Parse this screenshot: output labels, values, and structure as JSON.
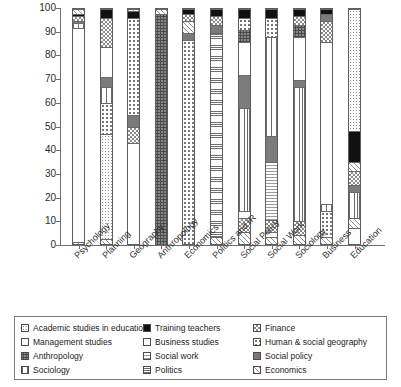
{
  "chart_data": {
    "type": "bar",
    "subtype": "stacked-100-percent",
    "title": "",
    "xlabel": "",
    "ylabel": "",
    "ylim": [
      0,
      100
    ],
    "yticks": [
      0,
      10,
      20,
      30,
      40,
      50,
      60,
      70,
      80,
      90,
      100
    ],
    "grid": false,
    "legend_position": "bottom",
    "categories": [
      "Psychology",
      "Planning",
      "Geography",
      "Anthropology",
      "Economics",
      "Politics and IR",
      "Social Policy",
      "Social Work",
      "Sociology",
      "Business",
      "Education"
    ],
    "series": [
      {
        "name": "Academic studies in education",
        "key": "p-acad",
        "values": [
          0,
          0,
          0,
          0,
          0,
          0,
          0,
          0,
          0,
          0,
          52
        ]
      },
      {
        "name": "Management studies",
        "key": "p-mgmt",
        "values": [
          92,
          0,
          0,
          0,
          0,
          0,
          3,
          2,
          0,
          3,
          7
        ]
      },
      {
        "name": "Anthropology",
        "key": "p-anthro",
        "values": [
          0,
          0,
          0,
          98,
          0,
          0,
          0,
          0,
          0,
          0,
          0
        ]
      },
      {
        "name": "Sociology",
        "key": "p-socio",
        "values": [
          2,
          7,
          0,
          0,
          0,
          0,
          43,
          45,
          57,
          3,
          11
        ]
      },
      {
        "name": "Training teachers",
        "key": "p-train",
        "values": [
          0,
          4,
          1,
          0,
          0,
          0,
          0,
          0,
          0,
          0,
          13
        ]
      },
      {
        "name": "Business studies",
        "key": "p-bus",
        "values": [
          0,
          17,
          41,
          0,
          0,
          0,
          0,
          0,
          0,
          69,
          0
        ]
      },
      {
        "name": "Social work",
        "key": "p-socwork",
        "values": [
          0,
          0,
          0,
          0,
          0,
          0,
          0,
          25,
          0,
          0,
          0
        ]
      },
      {
        "name": "Politics",
        "key": "p-pol",
        "values": [
          0,
          7,
          0,
          0,
          0,
          87,
          0,
          0,
          0,
          0,
          0
        ]
      },
      {
        "name": "Finance",
        "key": "p-fin",
        "values": [
          3,
          12,
          7,
          0,
          0,
          4,
          6,
          5,
          12,
          9,
          6
        ]
      },
      {
        "name": "Human & social geography",
        "key": "p-geo",
        "values": [
          0,
          47,
          45,
          0,
          87,
          0,
          0,
          12,
          0,
          11,
          0
        ]
      },
      {
        "name": "Social policy",
        "key": "p-socpol",
        "values": [
          0,
          4,
          5,
          0,
          8,
          6,
          14,
          11,
          3,
          3,
          3
        ]
      },
      {
        "name": "Economics",
        "key": "p-econ",
        "values": [
          3,
          2,
          1,
          2,
          5,
          3,
          34,
          0,
          28,
          2,
          8
        ]
      }
    ],
    "stack_order": [
      "Management studies",
      "Economics",
      "Human & social geography",
      "Finance",
      "Social policy",
      "Training teachers",
      "Academic studies in education",
      "Business studies",
      "Sociology",
      "Social work",
      "Politics",
      "Anthropology"
    ],
    "bars": [
      {
        "category": "Psychology",
        "segments": [
          {
            "series": "Economics",
            "key": "p-econ",
            "from": 0,
            "to": 1
          },
          {
            "series": "Management studies",
            "key": "p-mgmt",
            "from": 1,
            "to": 92
          },
          {
            "series": "Sociology",
            "key": "p-socio",
            "from": 92,
            "to": 94
          },
          {
            "series": "Social policy",
            "key": "p-socpol",
            "from": 94,
            "to": 95
          },
          {
            "series": "Finance",
            "key": "p-fin",
            "from": 95,
            "to": 97
          },
          {
            "series": "Training teachers",
            "key": "p-train",
            "from": 97,
            "to": 98
          },
          {
            "series": "Economics",
            "key": "p-econ",
            "from": 98,
            "to": 100
          }
        ]
      },
      {
        "category": "Planning",
        "segments": [
          {
            "series": "Economics",
            "key": "p-econ",
            "from": 0,
            "to": 2
          },
          {
            "series": "Academic studies in education",
            "key": "p-acad",
            "from": 2,
            "to": 47
          },
          {
            "series": "Human & social geography",
            "key": "p-geo",
            "from": 47,
            "to": 60
          },
          {
            "series": "Sociology",
            "key": "p-socio",
            "from": 60,
            "to": 67
          },
          {
            "series": "Social policy",
            "key": "p-socpol",
            "from": 67,
            "to": 71
          },
          {
            "series": "Business studies",
            "key": "p-bus",
            "from": 71,
            "to": 84
          },
          {
            "series": "Finance",
            "key": "p-fin",
            "from": 84,
            "to": 96
          },
          {
            "series": "Training teachers",
            "key": "p-train",
            "from": 96,
            "to": 100
          }
        ]
      },
      {
        "category": "Geography",
        "segments": [
          {
            "series": "Business studies",
            "key": "p-bus",
            "from": 0,
            "to": 43
          },
          {
            "series": "Finance",
            "key": "p-fin",
            "from": 43,
            "to": 50
          },
          {
            "series": "Social policy",
            "key": "p-socpol",
            "from": 50,
            "to": 55
          },
          {
            "series": "Human & social geography",
            "key": "p-geo",
            "from": 55,
            "to": 96
          },
          {
            "series": "Training teachers",
            "key": "p-train",
            "from": 96,
            "to": 99
          },
          {
            "series": "Economics",
            "key": "p-econ",
            "from": 99,
            "to": 100
          }
        ]
      },
      {
        "category": "Anthropology",
        "segments": [
          {
            "series": "Anthropology",
            "key": "p-anthro",
            "from": 0,
            "to": 98
          },
          {
            "series": "Economics",
            "key": "p-econ",
            "from": 98,
            "to": 100
          }
        ]
      },
      {
        "category": "Economics",
        "segments": [
          {
            "series": "Human & social geography",
            "key": "p-geo",
            "from": 0,
            "to": 87
          },
          {
            "series": "Social policy",
            "key": "p-socpol",
            "from": 87,
            "to": 90
          },
          {
            "series": "Economics",
            "key": "p-econ",
            "from": 90,
            "to": 95
          },
          {
            "series": "Finance",
            "key": "p-fin",
            "from": 95,
            "to": 98
          },
          {
            "series": "Training teachers",
            "key": "p-train",
            "from": 98,
            "to": 100
          }
        ]
      },
      {
        "category": "Politics and IR",
        "segments": [
          {
            "series": "Economics",
            "key": "p-econ",
            "from": 0,
            "to": 3
          },
          {
            "series": "Politics",
            "key": "p-pol",
            "from": 3,
            "to": 90
          },
          {
            "series": "Social policy",
            "key": "p-socpol",
            "from": 90,
            "to": 93
          },
          {
            "series": "Finance",
            "key": "p-fin",
            "from": 93,
            "to": 97
          },
          {
            "series": "Training teachers",
            "key": "p-train",
            "from": 97,
            "to": 100
          }
        ]
      },
      {
        "category": "Social Policy",
        "segments": [
          {
            "series": "Economics",
            "key": "p-econ",
            "from": 0,
            "to": 5
          },
          {
            "series": "Finance",
            "key": "p-fin",
            "from": 5,
            "to": 11
          },
          {
            "series": "Management studies",
            "key": "p-mgmt",
            "from": 11,
            "to": 14
          },
          {
            "series": "Sociology",
            "key": "p-socio",
            "from": 14,
            "to": 58
          },
          {
            "series": "Social policy",
            "key": "p-socpol",
            "from": 58,
            "to": 72
          },
          {
            "series": "Business studies",
            "key": "p-bus",
            "from": 72,
            "to": 86
          },
          {
            "series": "Anthropology",
            "key": "p-anthro",
            "from": 86,
            "to": 91
          },
          {
            "series": "Human & social geography",
            "key": "p-geo",
            "from": 91,
            "to": 96
          },
          {
            "series": "Training teachers",
            "key": "p-train",
            "from": 96,
            "to": 100
          }
        ]
      },
      {
        "category": "Social Work",
        "segments": [
          {
            "series": "Economics",
            "key": "p-econ",
            "from": 0,
            "to": 3
          },
          {
            "series": "Management studies",
            "key": "p-mgmt",
            "from": 3,
            "to": 5
          },
          {
            "series": "Finance",
            "key": "p-fin",
            "from": 5,
            "to": 10
          },
          {
            "series": "Social work",
            "key": "p-socwork",
            "from": 10,
            "to": 35
          },
          {
            "series": "Social policy",
            "key": "p-socpol",
            "from": 35,
            "to": 46
          },
          {
            "series": "Sociology",
            "key": "p-socio",
            "from": 46,
            "to": 88
          },
          {
            "series": "Human & social geography",
            "key": "p-geo",
            "from": 88,
            "to": 96
          },
          {
            "series": "Training teachers",
            "key": "p-train",
            "from": 96,
            "to": 100
          }
        ]
      },
      {
        "category": "Sociology",
        "segments": [
          {
            "series": "Economics",
            "key": "p-econ",
            "from": 0,
            "to": 4
          },
          {
            "series": "Finance",
            "key": "p-fin",
            "from": 4,
            "to": 10
          },
          {
            "series": "Sociology",
            "key": "p-socio",
            "from": 10,
            "to": 67
          },
          {
            "series": "Social policy",
            "key": "p-socpol",
            "from": 67,
            "to": 70
          },
          {
            "series": "Business studies",
            "key": "p-bus",
            "from": 70,
            "to": 88
          },
          {
            "series": "Anthropology",
            "key": "p-anthro",
            "from": 88,
            "to": 93
          },
          {
            "series": "Finance",
            "key": "p-fin",
            "from": 93,
            "to": 97
          },
          {
            "series": "Training teachers",
            "key": "p-train",
            "from": 97,
            "to": 100
          }
        ]
      },
      {
        "category": "Business",
        "segments": [
          {
            "series": "Economics",
            "key": "p-econ",
            "from": 0,
            "to": 3
          },
          {
            "series": "Human & social geography",
            "key": "p-geo",
            "from": 3,
            "to": 14
          },
          {
            "series": "Sociology",
            "key": "p-socio",
            "from": 14,
            "to": 17
          },
          {
            "series": "Business studies",
            "key": "p-bus",
            "from": 17,
            "to": 86
          },
          {
            "series": "Finance",
            "key": "p-fin",
            "from": 86,
            "to": 95
          },
          {
            "series": "Social policy",
            "key": "p-socpol",
            "from": 95,
            "to": 98
          },
          {
            "series": "Training teachers",
            "key": "p-train",
            "from": 98,
            "to": 100
          }
        ]
      },
      {
        "category": "Education",
        "segments": [
          {
            "series": "Management studies",
            "key": "p-mgmt",
            "from": 0,
            "to": 7
          },
          {
            "series": "Economics",
            "key": "p-econ",
            "from": 7,
            "to": 11
          },
          {
            "series": "Sociology",
            "key": "p-socio",
            "from": 11,
            "to": 22
          },
          {
            "series": "Social policy",
            "key": "p-socpol",
            "from": 22,
            "to": 25
          },
          {
            "series": "Finance",
            "key": "p-fin",
            "from": 25,
            "to": 31
          },
          {
            "series": "Economics",
            "key": "p-econ",
            "from": 31,
            "to": 35
          },
          {
            "series": "Training teachers",
            "key": "p-train",
            "from": 35,
            "to": 48
          },
          {
            "series": "Academic studies in education",
            "key": "p-acad",
            "from": 48,
            "to": 100
          }
        ]
      }
    ]
  },
  "legend": {
    "columns": [
      [
        {
          "label": "Academic studies in education",
          "key": "p-acad"
        },
        {
          "label": "Management studies",
          "key": "p-mgmt"
        },
        {
          "label": "Anthropology",
          "key": "p-anthro"
        },
        {
          "label": "Sociology",
          "key": "p-socio"
        }
      ],
      [
        {
          "label": "Training teachers",
          "key": "p-train"
        },
        {
          "label": "Business studies",
          "key": "p-bus"
        },
        {
          "label": "Social work",
          "key": "p-socwork"
        },
        {
          "label": "Politics",
          "key": "p-pol"
        }
      ],
      [
        {
          "label": "Finance",
          "key": "p-fin"
        },
        {
          "label": "Human & social geography",
          "key": "p-geo"
        },
        {
          "label": "Social policy",
          "key": "p-socpol"
        },
        {
          "label": "Economics",
          "key": "p-econ"
        }
      ]
    ]
  }
}
